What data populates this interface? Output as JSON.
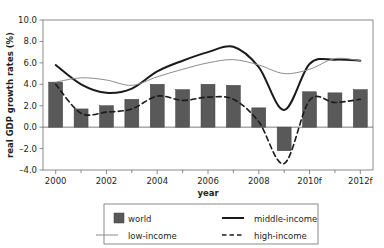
{
  "chart_data": {
    "type": "bar",
    "title": "",
    "xlabel": "year",
    "ylabel": "real GDP growth rates (%)",
    "xlim": [
      1999.5,
      2012.5
    ],
    "ylim": [
      -4.0,
      10.0
    ],
    "grid": false,
    "legend_position": "bottom",
    "x": [
      2000,
      2001,
      2002,
      2003,
      2004,
      2005,
      2006,
      2007,
      2008,
      2009,
      2010,
      2011,
      2012
    ],
    "categories": [
      "2000",
      "2001",
      "2002",
      "2003",
      "2004",
      "2005",
      "2006",
      "2007",
      "2008",
      "2009",
      "2010f",
      "2011f",
      "2012f"
    ],
    "xticks": [
      2000,
      2002,
      2004,
      2006,
      2008,
      2010,
      2012
    ],
    "xtick_labels": [
      "2000",
      "2002",
      "2004",
      "2006",
      "2008",
      "2010f",
      "2012f"
    ],
    "yticks": [
      -4.0,
      -2.0,
      0.0,
      2.0,
      4.0,
      6.0,
      8.0,
      10.0
    ],
    "ytick_labels": [
      "-4.0",
      "-2.0",
      "0.0",
      "2.0",
      "4.0",
      "6.0",
      "8.0",
      "10.0"
    ],
    "series": [
      {
        "name": "world",
        "kind": "bar",
        "color": "#595959",
        "values": [
          4.2,
          1.7,
          2.0,
          2.6,
          4.0,
          3.5,
          4.0,
          3.9,
          1.8,
          -2.2,
          3.3,
          3.2,
          3.5
        ]
      },
      {
        "name": "middle-income",
        "kind": "line",
        "style": "solid",
        "width": 2.0,
        "color": "#1a1a1a",
        "values": [
          5.8,
          4.0,
          3.2,
          3.6,
          5.2,
          6.2,
          7.0,
          7.5,
          5.6,
          1.6,
          5.9,
          6.3,
          6.2
        ]
      },
      {
        "name": "low-income",
        "kind": "line",
        "style": "solid",
        "width": 1.0,
        "color": "#8c8c8c",
        "values": [
          4.2,
          4.6,
          4.4,
          3.9,
          4.7,
          5.4,
          6.0,
          6.3,
          5.8,
          5.0,
          5.4,
          6.4,
          6.2
        ]
      },
      {
        "name": "high-income",
        "kind": "line",
        "style": "dashed",
        "width": 1.6,
        "color": "#1a1a1a",
        "values": [
          4.0,
          1.3,
          1.4,
          1.7,
          2.9,
          2.5,
          2.8,
          2.6,
          0.5,
          -3.4,
          2.5,
          2.3,
          2.6
        ]
      }
    ]
  },
  "axes": {
    "y_title": "real GDP growth rates (%)",
    "x_title": "year"
  },
  "legend": {
    "entries": [
      {
        "label": "world",
        "marker": "swatch",
        "color": "#595959"
      },
      {
        "label": "middle-income",
        "marker": "line-thick",
        "color": "#1a1a1a"
      },
      {
        "label": "low-income",
        "marker": "line-thin",
        "color": "#8c8c8c"
      },
      {
        "label": "high-income",
        "marker": "line-dashed",
        "color": "#1a1a1a"
      }
    ]
  }
}
